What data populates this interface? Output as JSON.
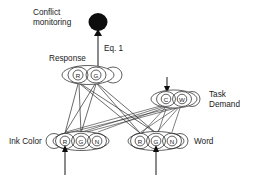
{
  "diagram": {
    "title_labels": {
      "conflict_line1": "Conflict",
      "conflict_line2": "monitoring",
      "equation": "Eq. 1",
      "response": "Response",
      "task_demand_line1": "Task",
      "task_demand_line2": "Demand",
      "ink_color": "Ink Color",
      "word": "Word"
    },
    "colors": {
      "stroke": "#2b2b2b",
      "fill": "#ffffff",
      "blob": "#0d0d0d",
      "text": "#1a1a1a"
    },
    "layers": [
      {
        "id": "response",
        "label": "Response",
        "nodes": [
          {
            "id": "response-r",
            "label": "R"
          },
          {
            "id": "response-g",
            "label": "G"
          }
        ],
        "self_loop_side": "right"
      },
      {
        "id": "task-demand",
        "label": "Task Demand",
        "nodes": [
          {
            "id": "task-demand-c",
            "label": "C"
          },
          {
            "id": "task-demand-w",
            "label": "W"
          }
        ],
        "self_loop_side": "right",
        "external_input": true
      },
      {
        "id": "ink-color",
        "label": "Ink Color",
        "nodes": [
          {
            "id": "ink-color-r",
            "label": "R"
          },
          {
            "id": "ink-color-g",
            "label": "G"
          },
          {
            "id": "ink-color-n",
            "label": "N"
          }
        ],
        "self_loop_side": "left",
        "external_input": true
      },
      {
        "id": "word",
        "label": "Word",
        "nodes": [
          {
            "id": "word-r",
            "label": "R"
          },
          {
            "id": "word-g",
            "label": "G"
          },
          {
            "id": "word-n",
            "label": "N"
          }
        ],
        "self_loop_side": "right",
        "external_input": true
      }
    ],
    "monitor_node": {
      "id": "conflict-monitor",
      "label": "Conflict monitoring",
      "edge_label": "Eq. 1"
    }
  }
}
